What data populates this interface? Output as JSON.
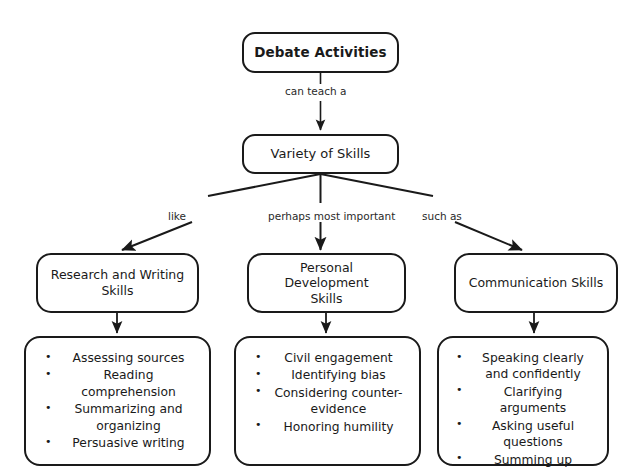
{
  "diagram": {
    "background_color": "#ffffff",
    "stroke_color": "#1a1a1a",
    "text_color": "#1a1a1a",
    "root": {
      "label": "Debate Activities"
    },
    "level2": {
      "label": "Variety of Skills"
    },
    "edges": {
      "root_to_variety": "can teach a",
      "variety_to_research": "like",
      "variety_to_personal": "perhaps most important",
      "variety_to_communication": "such as"
    },
    "categories": [
      {
        "label": "Research and Writing\nSkills",
        "details": [
          "Assessing sources",
          "Reading comprehension",
          "Summarizing and organizing",
          "Persuasive writing"
        ]
      },
      {
        "label": "Personal Development\nSkills",
        "details": [
          "Civil engagement",
          "Identifying bias",
          "Considering counter-evidence",
          "Honoring humility"
        ]
      },
      {
        "label": "Communication Skills",
        "details": [
          "Speaking clearly and confidently",
          "Clarifying arguments",
          "Asking useful questions",
          "Summing up"
        ]
      }
    ]
  }
}
